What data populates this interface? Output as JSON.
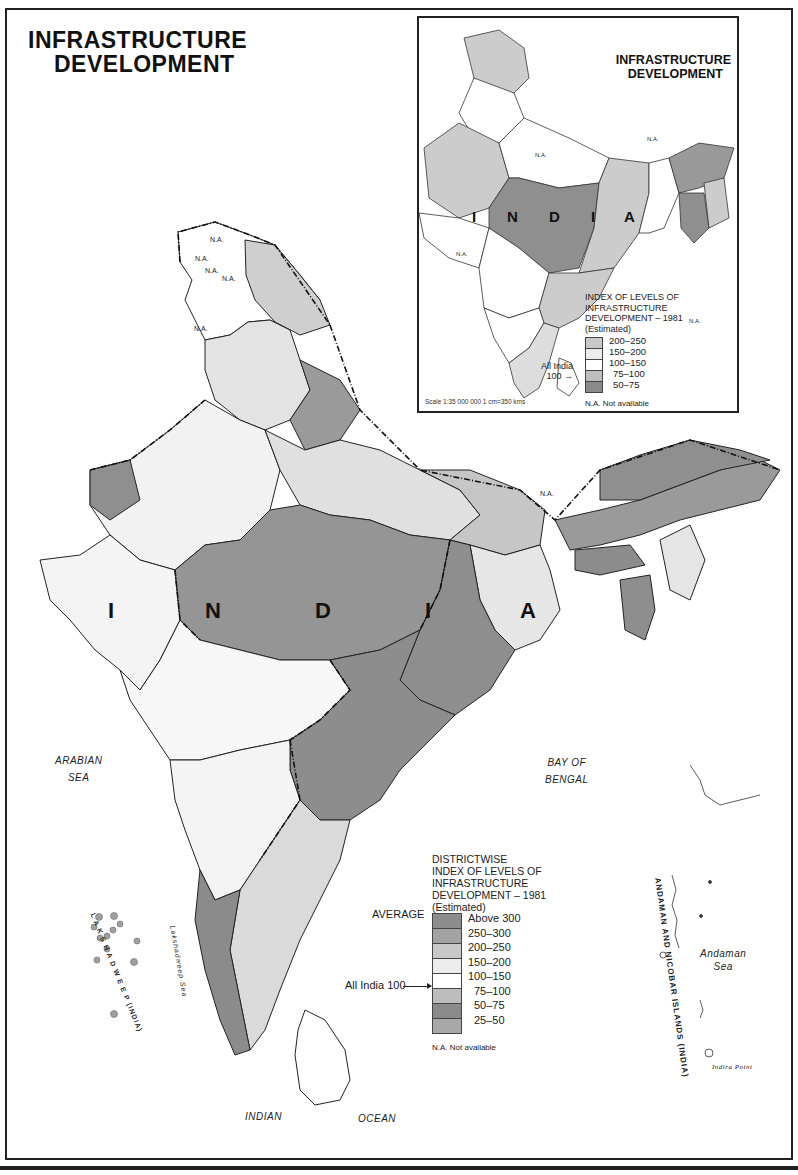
{
  "title": {
    "line1": "INFRASTRUCTURE",
    "line2": "DEVELOPMENT"
  },
  "colors": {
    "above_300": "#8c8c8c",
    "250_300": "#a3a3a3",
    "200_250": "#c8c8c8",
    "150_200": "#e8e8e8",
    "100_150": "#ffffff",
    "75_100": "#bdbdbd",
    "50_75": "#8a8a8a",
    "25_50": "#a8a8a8",
    "border": "#222222"
  },
  "main_map": {
    "country_letters": [
      "I",
      "N",
      "D",
      "I",
      "A"
    ],
    "seas": {
      "arabian_line1": "ARABIAN",
      "arabian_line2": "SEA",
      "bay_line1": "BAY OF",
      "bay_line2": "BENGAL",
      "indian": "INDIAN",
      "ocean": "OCEAN",
      "andaman_line1": "Andaman",
      "andaman_line2": "Sea",
      "lakshadweep_sea": "Lakshadweep Sea"
    },
    "island_labels": {
      "lakshadweep": "L A K S H A D W E E P (INDIA)",
      "andaman": "ANDAMAN AND NICOBAR ISLANDS (INDIA)",
      "indira_point": "Indira Point"
    },
    "na_labels": [
      "N.A.",
      "N.A.",
      "N.A.",
      "N.A.",
      "N.A.",
      "N.A."
    ],
    "legend": {
      "heading": [
        "DISTRICTWISE",
        "INDEX OF LEVELS OF",
        "INFRASTRUCTURE",
        "DEVELOPMENT – 1981",
        "(Estimated)"
      ],
      "average_label": "AVERAGE",
      "all_india_label": "All India 100",
      "ranges": [
        "Above 300",
        "250–300",
        "200–250",
        "150–200",
        "100–150",
        "75–100",
        "50–75",
        "25–50"
      ],
      "na_note": "N.A. Not available"
    }
  },
  "inset": {
    "title": {
      "line1": "INFRASTRUCTURE",
      "line2": "DEVELOPMENT"
    },
    "country_letters": [
      "I",
      "N",
      "D",
      "I",
      "A"
    ],
    "na_labels": [
      "N.A.",
      "N.A.",
      "N.A.",
      "N.A."
    ],
    "legend": {
      "heading": [
        "INDEX OF LEVELS OF",
        "INFRASTRUCTURE",
        "DEVELOPMENT – 1981",
        "(Estimated)"
      ],
      "all_india_line1": "All India",
      "all_india_line2": "100 →",
      "ranges": [
        "200–250",
        "150–200",
        "100–150",
        "75–100",
        "50–75"
      ],
      "na_note": "N.A. Not available"
    },
    "scale": "Scale 1:35 000 000    1 cm=350 kms"
  }
}
